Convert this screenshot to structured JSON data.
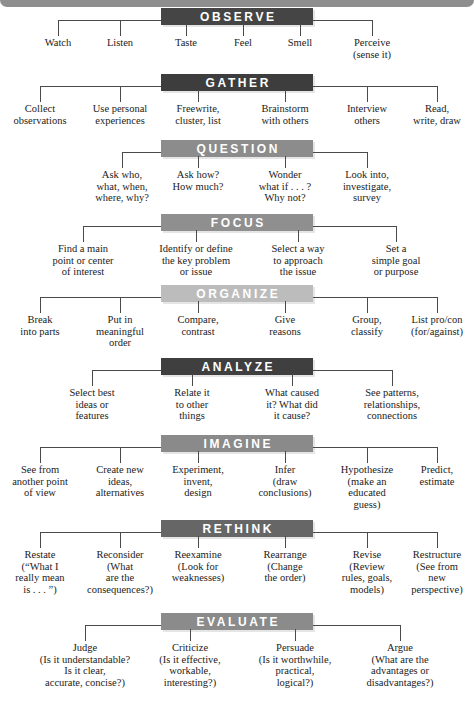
{
  "document": {
    "title": "Thinking and Writing Moves",
    "type": "hierarchy-diagram"
  },
  "chart_data": {
    "type": "diagram",
    "layout": "stacked horizontal tree, one header bar per stage with branch leaves below",
    "stages": [
      {
        "label": "OBSERVE",
        "bar_color": "#454545",
        "leaves": [
          {
            "lines": [
              "Watch"
            ]
          },
          {
            "lines": [
              "Listen"
            ]
          },
          {
            "lines": [
              "Taste"
            ]
          },
          {
            "lines": [
              "Feel"
            ]
          },
          {
            "lines": [
              "Smell"
            ]
          },
          {
            "lines": [
              "Perceive",
              "(sense it)"
            ]
          }
        ]
      },
      {
        "label": "GATHER",
        "bar_color": "#3d3d3d",
        "leaves": [
          {
            "lines": [
              "Collect",
              "observations"
            ]
          },
          {
            "lines": [
              "Use personal",
              "experiences"
            ]
          },
          {
            "lines": [
              "Freewrite,",
              "cluster, list"
            ]
          },
          {
            "lines": [
              "Brainstorm",
              "with others"
            ]
          },
          {
            "lines": [
              "Interview",
              "others"
            ]
          },
          {
            "lines": [
              "Read,",
              "write, draw"
            ]
          }
        ]
      },
      {
        "label": "QUESTION",
        "bar_color": "#8c8c8c",
        "leaves": [
          {
            "lines": [
              "Ask who,",
              "what, when,",
              "where, why?"
            ]
          },
          {
            "lines": [
              "Ask how?",
              "How much?"
            ]
          },
          {
            "lines": [
              "Wonder",
              "what if . . . ?",
              "Why not?"
            ]
          },
          {
            "lines": [
              "Look into,",
              "investigate,",
              "survey"
            ]
          }
        ]
      },
      {
        "label": "FOCUS",
        "bar_color": "#8f8f8f",
        "leaves": [
          {
            "lines": [
              "Find a main",
              "point or center",
              "of interest"
            ]
          },
          {
            "lines": [
              "Identify or define",
              "the key problem",
              "or issue"
            ]
          },
          {
            "lines": [
              "Select a way",
              "to approach",
              "the issue"
            ]
          },
          {
            "lines": [
              "Set a",
              "simple goal",
              "or purpose"
            ]
          }
        ]
      },
      {
        "label": "ORGANIZE",
        "bar_color": "#bcbcbc",
        "leaves": [
          {
            "lines": [
              "Break",
              "into parts"
            ]
          },
          {
            "lines": [
              "Put in",
              "meaningful",
              "order"
            ]
          },
          {
            "lines": [
              "Compare,",
              "contrast"
            ]
          },
          {
            "lines": [
              "Give",
              "reasons"
            ]
          },
          {
            "lines": [
              "Group,",
              "classify"
            ]
          },
          {
            "lines": [
              "List pro/con",
              "(for/against)"
            ]
          }
        ]
      },
      {
        "label": "ANALYZE",
        "bar_color": "#3f3f3f",
        "leaves": [
          {
            "lines": [
              "Select best",
              "ideas or",
              "features"
            ]
          },
          {
            "lines": [
              "Relate it",
              "to other",
              "things"
            ]
          },
          {
            "lines": [
              "What caused",
              "it? What did",
              "it cause?"
            ]
          },
          {
            "lines": [
              "See patterns,",
              "relationships,",
              "connections"
            ]
          }
        ]
      },
      {
        "label": "IMAGINE",
        "bar_color": "#8a8a8a",
        "leaves": [
          {
            "lines": [
              "See from",
              "another point",
              "of view"
            ]
          },
          {
            "lines": [
              "Create new",
              "ideas,",
              "alternatives"
            ]
          },
          {
            "lines": [
              "Experiment,",
              "invent,",
              "design"
            ]
          },
          {
            "lines": [
              "Infer",
              "(draw",
              "conclusions)"
            ]
          },
          {
            "lines": [
              "Hypothesize",
              "(make an",
              "educated",
              "guess)"
            ]
          },
          {
            "lines": [
              "Predict,",
              "estimate"
            ]
          }
        ]
      },
      {
        "label": "RETHINK",
        "bar_color": "#666666",
        "leaves": [
          {
            "lines": [
              "Restate",
              "(“What I",
              "really mean",
              "is . . . ”)"
            ]
          },
          {
            "lines": [
              "Reconsider",
              "(What",
              "are the",
              "consequences?)"
            ]
          },
          {
            "lines": [
              "Reexamine",
              "(Look for",
              "weaknesses)"
            ]
          },
          {
            "lines": [
              "Rearrange",
              "(Change",
              "the order)"
            ]
          },
          {
            "lines": [
              "Revise",
              "(Review",
              "rules, goals,",
              "models)"
            ]
          },
          {
            "lines": [
              "Restructure",
              "(See from",
              "new",
              "perspective)"
            ]
          }
        ]
      },
      {
        "label": "EVALUATE",
        "bar_color": "#8b8b8b",
        "leaves": [
          {
            "lines": [
              "Judge",
              "(Is it understandable?",
              "Is it clear,",
              "accurate, concise?)"
            ]
          },
          {
            "lines": [
              "Criticize",
              "(Is it effective,",
              "workable,",
              "interesting?)"
            ]
          },
          {
            "lines": [
              "Persuade",
              "(Is it worthwhile,",
              "practical,",
              "logical?)"
            ]
          },
          {
            "lines": [
              "Argue",
              "(What are the",
              "advantages or",
              "disadvantages?)"
            ]
          }
        ]
      }
    ]
  },
  "geometry": {
    "stage_tops": [
      8,
      74,
      140,
      214,
      285,
      358,
      435,
      520,
      613
    ],
    "branch_x": {
      "six": [
        44,
        122,
        198,
        285,
        367,
        437
      ],
      "four_wide": [
        85,
        190,
        295,
        400
      ],
      "four_mid": [
        75,
        190,
        295,
        400
      ]
    }
  }
}
